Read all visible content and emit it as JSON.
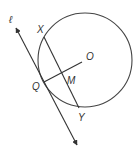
{
  "diagram": {
    "type": "geometry",
    "stroke_color": "#333333",
    "circle": {
      "cx": 85,
      "cy": 60,
      "r": 47,
      "center_label": "O"
    },
    "line": {
      "label": "ℓ",
      "from": [
        16,
        28
      ],
      "to": [
        77,
        145
      ],
      "tangent_point": "Q"
    },
    "chord": {
      "from_label": "X",
      "to_label": "Y",
      "from": [
        44,
        37
      ],
      "to": [
        79,
        108
      ]
    },
    "segment": {
      "from_label": "Q",
      "to_label": "O",
      "midpoint_label": "M",
      "from": [
        44,
        82
      ],
      "to": [
        82,
        62
      ]
    },
    "labels": {
      "l": "ℓ",
      "X": "X",
      "O": "O",
      "M": "M",
      "Q": "Q",
      "Y": "Y"
    }
  }
}
